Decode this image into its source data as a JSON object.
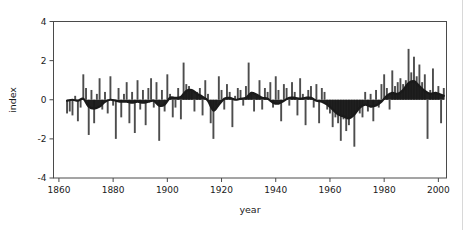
{
  "chart_data": {
    "type": "bar",
    "title": "",
    "subtitle": "",
    "xlabel": "year",
    "ylabel": "index",
    "xlim": [
      1858,
      2003
    ],
    "ylim": [
      -4,
      4
    ],
    "xticks": [
      1860,
      1880,
      1900,
      1920,
      1940,
      1960,
      1980,
      2000
    ],
    "xtick_labels": [
      "1860",
      "1880",
      "1900",
      "1920",
      "1940",
      "1960",
      "1980",
      "2000"
    ],
    "yticks": [
      -4,
      -2,
      0,
      2,
      4
    ],
    "ytick_labels": [
      "-4",
      "-2",
      "0",
      "2",
      "4"
    ],
    "grid": false,
    "legend": null,
    "series": [
      {
        "name": "annual index",
        "type": "bar",
        "color": "#4d4d4d",
        "x": [
          1863,
          1864,
          1865,
          1866,
          1867,
          1868,
          1869,
          1870,
          1871,
          1872,
          1873,
          1874,
          1875,
          1876,
          1877,
          1878,
          1879,
          1880,
          1881,
          1882,
          1883,
          1884,
          1885,
          1886,
          1887,
          1888,
          1889,
          1890,
          1891,
          1892,
          1893,
          1894,
          1895,
          1896,
          1897,
          1898,
          1899,
          1900,
          1901,
          1902,
          1903,
          1904,
          1905,
          1906,
          1907,
          1908,
          1909,
          1910,
          1911,
          1912,
          1913,
          1914,
          1915,
          1916,
          1917,
          1918,
          1919,
          1920,
          1921,
          1922,
          1923,
          1924,
          1925,
          1926,
          1927,
          1928,
          1929,
          1930,
          1931,
          1932,
          1933,
          1934,
          1935,
          1936,
          1937,
          1938,
          1939,
          1940,
          1941,
          1942,
          1943,
          1944,
          1945,
          1946,
          1947,
          1948,
          1949,
          1950,
          1951,
          1952,
          1953,
          1954,
          1955,
          1956,
          1957,
          1958,
          1959,
          1960,
          1961,
          1962,
          1963,
          1964,
          1965,
          1966,
          1967,
          1968,
          1969,
          1970,
          1971,
          1972,
          1973,
          1974,
          1975,
          1976,
          1977,
          1978,
          1979,
          1980,
          1981,
          1982,
          1983,
          1984,
          1985,
          1986,
          1987,
          1988,
          1989,
          1990,
          1991,
          1992,
          1993,
          1994,
          1995,
          1996,
          1997,
          1998,
          1999,
          2000,
          2001,
          2002
        ],
        "values": [
          -0.7,
          -0.6,
          -0.8,
          0.2,
          -1.1,
          -0.4,
          1.3,
          0.6,
          -1.8,
          0.5,
          -1.2,
          0.3,
          1.1,
          -0.5,
          0.4,
          -0.7,
          1.2,
          -0.3,
          -2.0,
          0.6,
          -0.9,
          0.3,
          0.9,
          -1.2,
          0.4,
          -1.7,
          1.0,
          -0.5,
          0.5,
          -1.3,
          0.6,
          1.1,
          -0.4,
          0.9,
          -2.1,
          0.5,
          -0.6,
          1.3,
          0.3,
          -0.9,
          -0.4,
          0.6,
          -1.0,
          1.9,
          0.8,
          0.7,
          0.5,
          -0.6,
          0.4,
          0.6,
          -0.8,
          1.0,
          0.3,
          -1.2,
          -2.0,
          -0.3,
          1.2,
          0.5,
          -0.5,
          0.8,
          0.4,
          -1.4,
          0.2,
          0.6,
          0.5,
          -0.3,
          0.7,
          1.9,
          0.4,
          -0.6,
          0.3,
          1.0,
          -0.5,
          0.6,
          0.4,
          0.9,
          -0.4,
          1.2,
          0.5,
          -1.1,
          0.8,
          0.6,
          -0.3,
          0.9,
          0.4,
          -0.8,
          1.1,
          0.3,
          -1.3,
          0.5,
          0.7,
          -0.4,
          0.8,
          -1.2,
          0.6,
          0.4,
          -0.5,
          -0.7,
          -1.4,
          -0.9,
          -1.2,
          -2.1,
          -1.0,
          -1.6,
          -1.3,
          -0.8,
          -2.4,
          -0.5,
          -0.7,
          -0.9,
          0.4,
          -0.6,
          0.3,
          -1.1,
          0.5,
          -0.4,
          0.8,
          1.3,
          0.6,
          -0.5,
          1.5,
          0.7,
          0.9,
          1.1,
          0.8,
          1.0,
          2.6,
          1.4,
          2.2,
          1.2,
          1.8,
          0.9,
          1.3,
          -2.0,
          0.5,
          1.6,
          0.4,
          0.7,
          -1.2,
          0.6
        ]
      },
      {
        "name": "smoothed trend",
        "type": "line-area",
        "color": "#1a1a1a",
        "x": [
          1863,
          1865,
          1867,
          1869,
          1871,
          1873,
          1875,
          1877,
          1879,
          1881,
          1883,
          1885,
          1887,
          1889,
          1891,
          1893,
          1895,
          1897,
          1899,
          1901,
          1903,
          1905,
          1907,
          1909,
          1911,
          1913,
          1915,
          1917,
          1919,
          1921,
          1923,
          1925,
          1927,
          1929,
          1931,
          1933,
          1935,
          1937,
          1939,
          1941,
          1943,
          1945,
          1947,
          1949,
          1951,
          1953,
          1955,
          1957,
          1959,
          1961,
          1963,
          1965,
          1967,
          1969,
          1971,
          1973,
          1975,
          1977,
          1979,
          1981,
          1983,
          1985,
          1987,
          1989,
          1991,
          1993,
          1995,
          1997,
          1999,
          2001,
          2002
        ],
        "values": [
          -0.05,
          0.0,
          -0.05,
          0.05,
          -0.35,
          -0.45,
          -0.35,
          -0.1,
          0.0,
          -0.05,
          -0.1,
          -0.1,
          -0.15,
          -0.1,
          -0.15,
          -0.1,
          -0.05,
          -0.3,
          -0.25,
          0.1,
          0.1,
          0.15,
          0.45,
          0.5,
          0.3,
          0.15,
          -0.05,
          -0.55,
          -0.25,
          0.05,
          0.1,
          0.0,
          0.05,
          0.1,
          0.35,
          0.25,
          0.1,
          0.05,
          -0.15,
          -0.2,
          -0.05,
          0.1,
          0.1,
          0.05,
          0.1,
          0.1,
          -0.05,
          -0.1,
          -0.25,
          -0.5,
          -0.75,
          -0.85,
          -0.95,
          -0.75,
          -0.4,
          -0.25,
          -0.35,
          -0.3,
          -0.1,
          0.2,
          0.35,
          0.3,
          0.5,
          0.85,
          0.95,
          0.7,
          0.45,
          0.3,
          0.35,
          0.25,
          0.2
        ]
      }
    ]
  },
  "axes": {
    "x_title": "year",
    "y_title": "index"
  }
}
